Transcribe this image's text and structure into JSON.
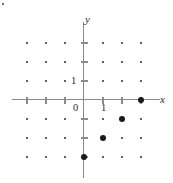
{
  "figure": {
    "type": "coordinate-plane-lattice",
    "axis_labels": {
      "x": "x",
      "y": "y"
    },
    "origin_label": "0",
    "tick_labels": {
      "x_one": "1",
      "y_one": "1"
    },
    "colors": {
      "axis": "#8a8a8a",
      "dot": "#2b2b2b",
      "highlight_dot": "#1a1a1a",
      "background": "#ffffff",
      "text": "#2b2b2b"
    }
  },
  "chart_data": {
    "type": "scatter",
    "title": "",
    "xlabel": "x",
    "ylabel": "y",
    "xlim": [
      -4,
      4
    ],
    "ylim": [
      -4,
      4
    ],
    "grid": false,
    "unit_spacing_px": 19,
    "origin_px": {
      "x": 84,
      "y": 100
    },
    "x_ticks": [
      -3,
      -2,
      -1,
      0,
      1,
      2,
      3
    ],
    "y_ticks": [
      -3,
      -2,
      -1,
      0,
      1,
      2,
      3
    ],
    "labeled_ticks": {
      "x": [
        1
      ],
      "y": [
        1
      ]
    },
    "series": [
      {
        "name": "lattice-points",
        "marker": "small-dot",
        "points": [
          [
            -3,
            3
          ],
          [
            -2,
            3
          ],
          [
            -1,
            3
          ],
          [
            1,
            3
          ],
          [
            2,
            3
          ],
          [
            3,
            3
          ],
          [
            -3,
            2
          ],
          [
            -2,
            2
          ],
          [
            -1,
            2
          ],
          [
            1,
            2
          ],
          [
            2,
            2
          ],
          [
            3,
            2
          ],
          [
            -3,
            1
          ],
          [
            -2,
            1
          ],
          [
            -1,
            1
          ],
          [
            1,
            1
          ],
          [
            2,
            1
          ],
          [
            3,
            1
          ],
          [
            -3,
            -1
          ],
          [
            -2,
            -1
          ],
          [
            -1,
            -1
          ],
          [
            1,
            -1
          ],
          [
            3,
            -1
          ],
          [
            -3,
            -2
          ],
          [
            -2,
            -2
          ],
          [
            -1,
            -2
          ],
          [
            2,
            -2
          ],
          [
            3,
            -2
          ],
          [
            -3,
            -3
          ],
          [
            -2,
            -3
          ],
          [
            -1,
            -3
          ],
          [
            1,
            -3
          ],
          [
            2,
            -3
          ],
          [
            3,
            -3
          ]
        ]
      },
      {
        "name": "highlighted-points",
        "marker": "large-dot",
        "points": [
          [
            3,
            0
          ],
          [
            2,
            -1
          ],
          [
            1,
            -2
          ],
          [
            0,
            -3
          ]
        ]
      }
    ]
  }
}
